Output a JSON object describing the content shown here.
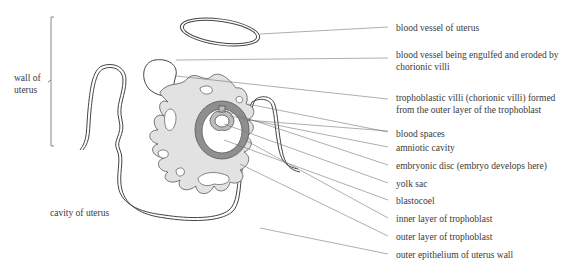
{
  "diagram": {
    "type": "labelled anatomical diagram",
    "colors": {
      "outline": "#444444",
      "villi_fill": "#e2e2e2",
      "inner_trophoblast": "#8f8f8f",
      "leader_line": "#777777",
      "text": "#3a3a3a"
    }
  },
  "left_labels": {
    "wall_of_uterus": "wall of uterus",
    "cavity_of_uterus": "cavity of uterus"
  },
  "right_labels": [
    "blood vessel of uterus",
    "blood vessel being engulfed and eroded by chorionic villi",
    "trophoblastic villi (chorionic villi) formed from the outer layer of the trophoblast",
    "blood spaces",
    "amniotic cavity",
    "embryonic disc (embryo develops here)",
    "yolk sac",
    "blastocoel",
    "inner layer of trophoblast",
    "outer layer of trophoblast",
    "outer epithelium of uterus wall"
  ]
}
